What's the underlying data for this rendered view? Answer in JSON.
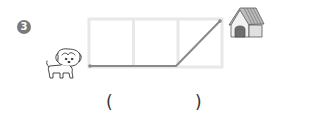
{
  "problem": {
    "number": "3",
    "number_glyph": "❸",
    "answer_open": "(",
    "answer_close": ")",
    "answer_value": ""
  },
  "figure": {
    "grid": {
      "columns": 3,
      "rows": 1,
      "border_color": "#e6e6e6"
    },
    "path": {
      "color": "#8a8a8a",
      "description": "from dog along bottom edge two cells, then diagonal up across third cell to doghouse"
    },
    "start_icon": "dog-icon",
    "end_icon": "doghouse-icon"
  }
}
